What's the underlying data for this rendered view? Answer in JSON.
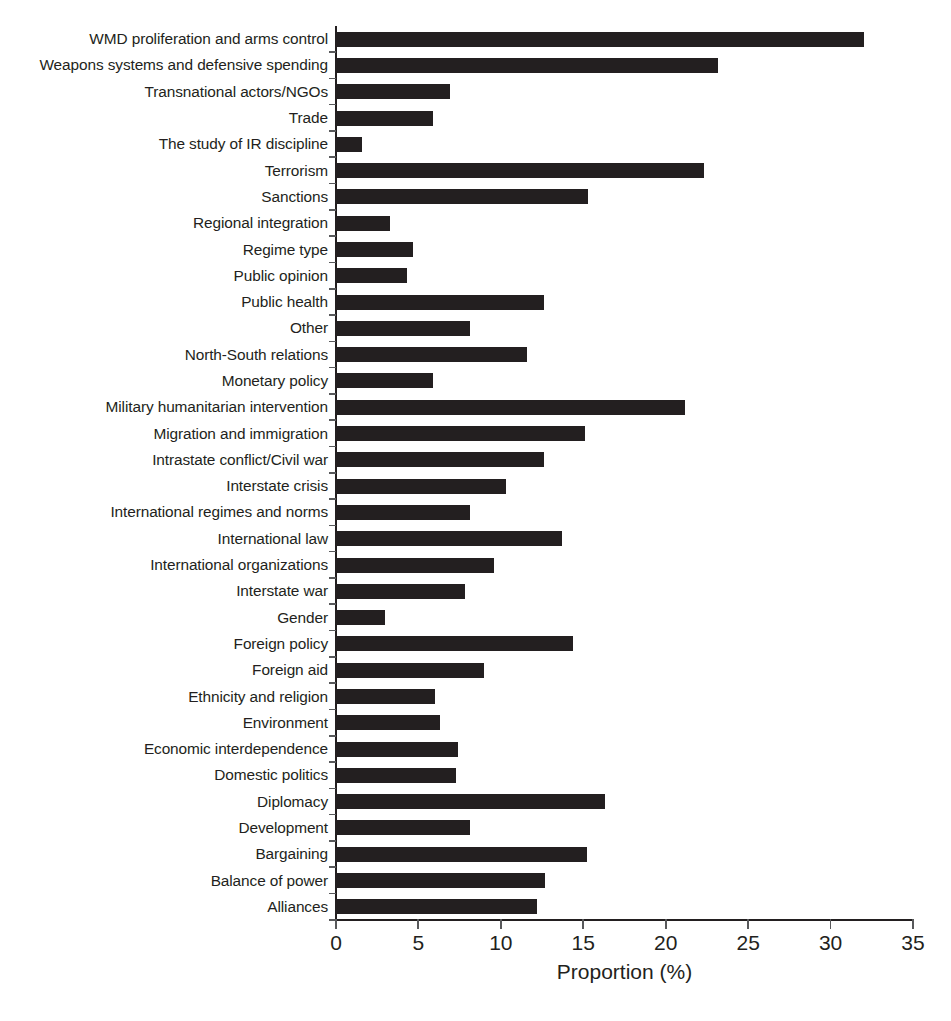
{
  "chart_data": {
    "type": "bar",
    "orientation": "horizontal",
    "title": "",
    "subtitle": "",
    "xlabel": "Proportion (%)",
    "ylabel": "",
    "xlim": [
      0,
      35
    ],
    "xticks": [
      0,
      5,
      10,
      15,
      20,
      25,
      30,
      35
    ],
    "xtick_labels": [
      "0",
      "5",
      "10",
      "15",
      "20",
      "25",
      "30",
      "35"
    ],
    "grid": false,
    "legend": null,
    "bar_color": "#231f20",
    "background_color": "#ffffff",
    "categories": [
      "WMD proliferation and arms control",
      "Weapons systems and defensive spending",
      "Transnational actors/NGOs",
      "Trade",
      "The study of IR discipline",
      "Terrorism",
      "Sanctions",
      "Regional integration",
      "Regime type",
      "Public opinion",
      "Public health",
      "Other",
      "North-South relations",
      "Monetary policy",
      "Military humanitarian intervention",
      "Migration and immigration",
      "Intrastate conflict/Civil war",
      "Interstate crisis",
      "International regimes and norms",
      "International law",
      "International organizations",
      "Interstate war",
      "Gender",
      "Foreign policy",
      "Foreign aid",
      "Ethnicity and religion",
      "Environment",
      "Economic interdependence",
      "Domestic politics",
      "Diplomacy",
      "Development",
      "Bargaining",
      "Balance of power",
      "Alliances"
    ],
    "values": [
      32.0,
      23.2,
      6.9,
      5.9,
      1.6,
      22.3,
      15.3,
      3.3,
      4.7,
      4.3,
      12.6,
      8.1,
      11.6,
      5.9,
      21.2,
      15.1,
      12.6,
      10.3,
      8.1,
      13.7,
      9.6,
      7.8,
      3.0,
      14.4,
      9.0,
      6.0,
      6.3,
      7.4,
      7.3,
      16.3,
      8.1,
      15.2,
      12.7,
      12.2
    ]
  }
}
